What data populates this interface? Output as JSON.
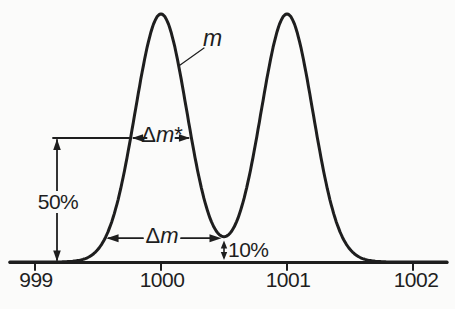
{
  "figure": {
    "background": "#fbfbfa",
    "ink": "#1e1e1e"
  },
  "chart_data": {
    "type": "line",
    "title": "",
    "xlabel": "",
    "ylabel": "",
    "x_range": [
      999,
      1002
    ],
    "x_ticks": [
      "999",
      "1000",
      "1001",
      "1002"
    ],
    "x_tick_values": [
      999,
      1000,
      1001,
      1002
    ],
    "grid": false,
    "legend": false,
    "series": [
      {
        "name": "two overlapping mass peaks",
        "model": "gaussian_sum",
        "peaks": [
          {
            "center": 1000,
            "sigma": 0.205,
            "height": 1.0
          },
          {
            "center": 1001,
            "sigma": 0.205,
            "height": 1.0
          }
        ]
      }
    ],
    "half_height_pct": 50,
    "valley_pct": 10,
    "annotations": [
      "m labels the first peak curve",
      "Δm* is the peak width measured at 50% height",
      "Δm is the peak separation width at the 10% valley",
      "vertical arrow marks 50% of peak height",
      "small vertical arrow marks 10% valley height"
    ]
  },
  "labels": {
    "peak_curve": "m",
    "delta_m_star": {
      "delta": "Δ",
      "m": "m",
      "star": "*"
    },
    "delta_m": {
      "delta": "Δ",
      "m": "m"
    },
    "pct50": "50%",
    "pct10": "10%"
  }
}
